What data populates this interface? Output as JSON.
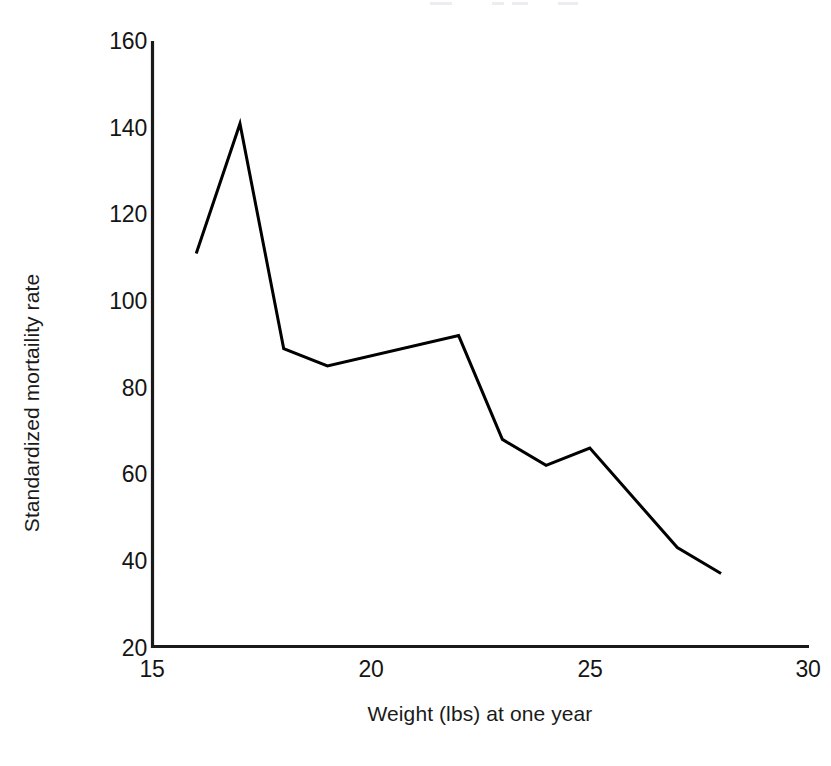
{
  "chart_data": {
    "type": "line",
    "title": "",
    "xlabel": "Weight (lbs) at one year",
    "ylabel": "Standardized mortaility rate",
    "xlim": [
      15,
      30
    ],
    "ylim": [
      20,
      160
    ],
    "xticks": [
      15,
      20,
      25,
      30
    ],
    "yticks": [
      20,
      40,
      60,
      80,
      100,
      120,
      140,
      160
    ],
    "xtick_labels": [
      "15",
      "20",
      "25",
      "30"
    ],
    "ytick_labels": [
      "20",
      "40",
      "60",
      "80",
      "100",
      "120",
      "140",
      "160"
    ],
    "grid": false,
    "legend": null,
    "series": [
      {
        "name": "Standardized mortaility rate",
        "color": "#000000",
        "line_width": 3,
        "markers": false,
        "x": [
          16,
          17,
          18,
          19,
          22,
          23,
          24,
          25,
          27,
          28
        ],
        "y": [
          111,
          141,
          89,
          85,
          92,
          68,
          62,
          66,
          43,
          37
        ]
      }
    ]
  },
  "axes": {
    "y_title": "Standardized mortaility rate",
    "x_title": "Weight (lbs) at one year"
  },
  "colors": {
    "line": "#000000",
    "axis": "#1a1a1a",
    "background": "#ffffff",
    "text": "#151515"
  }
}
